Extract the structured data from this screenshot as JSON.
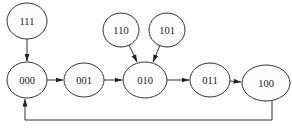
{
  "diagram": {
    "type": "state-transition",
    "nodes": [
      {
        "id": "111",
        "label": "111",
        "cx": 27,
        "cy": 21,
        "rx": 20,
        "ry": 18
      },
      {
        "id": "000",
        "label": "000",
        "cx": 27,
        "cy": 80,
        "rx": 20,
        "ry": 18
      },
      {
        "id": "001",
        "label": "001",
        "cx": 84,
        "cy": 80,
        "rx": 20,
        "ry": 17
      },
      {
        "id": "110",
        "label": "110",
        "cx": 121,
        "cy": 30,
        "rx": 18,
        "ry": 17
      },
      {
        "id": "101",
        "label": "101",
        "cx": 167,
        "cy": 30,
        "rx": 18,
        "ry": 17
      },
      {
        "id": "010",
        "label": "010",
        "cx": 145,
        "cy": 80,
        "rx": 22,
        "ry": 18
      },
      {
        "id": "011",
        "label": "011",
        "cx": 210,
        "cy": 80,
        "rx": 20,
        "ry": 17
      },
      {
        "id": "100",
        "label": "100",
        "cx": 266,
        "cy": 83,
        "rx": 24,
        "ry": 18
      }
    ],
    "edges": [
      {
        "from": "111",
        "to": "000"
      },
      {
        "from": "000",
        "to": "001"
      },
      {
        "from": "001",
        "to": "010"
      },
      {
        "from": "110",
        "to": "010"
      },
      {
        "from": "101",
        "to": "010"
      },
      {
        "from": "010",
        "to": "011"
      },
      {
        "from": "011",
        "to": "100"
      },
      {
        "from": "100",
        "to": "000",
        "routing": "orthogonal-below"
      }
    ],
    "colors": {
      "stroke": "#333333",
      "background": "#ffffff",
      "text": "#222222"
    }
  }
}
